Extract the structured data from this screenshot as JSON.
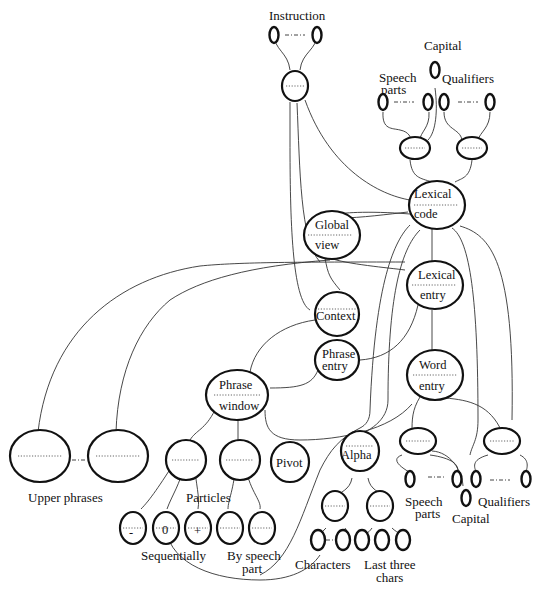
{
  "diagram": {
    "top_cropped_fragment": "",
    "labels": {
      "instruction": "Instruction",
      "capital_top": "Capital",
      "speech_parts_top_1": "Speech",
      "speech_parts_top_2": "parts",
      "qualifiers_top": "Qualifiers",
      "upper_phrases": "Upper phrases",
      "particles": "Particles",
      "sequentially": "Sequentially",
      "by_speech_part_1": "By speech",
      "by_speech_part_2": "part",
      "characters": "Characters",
      "last_three_1": "Last three",
      "last_three_2": "chars",
      "speech_parts_bottom_1": "Speech",
      "speech_parts_bottom_2": "parts",
      "capital_bottom": "Capital",
      "qualifiers_bottom": "Qualifiers"
    },
    "nodes": {
      "lexical_code": [
        "Lexical",
        "code"
      ],
      "global_view": [
        "Global",
        "view"
      ],
      "lexical_entry": [
        "Lexical",
        "entry"
      ],
      "context": "Context",
      "phrase_entry": [
        "Phrase",
        "entry"
      ],
      "phrase_window": [
        "Phrase",
        "window"
      ],
      "word_entry": [
        "Word",
        "entry"
      ],
      "pivot": "Pivot",
      "alpha": "Alpha",
      "seq_minus": "-",
      "seq_zero": "0",
      "seq_plus": "+"
    }
  }
}
